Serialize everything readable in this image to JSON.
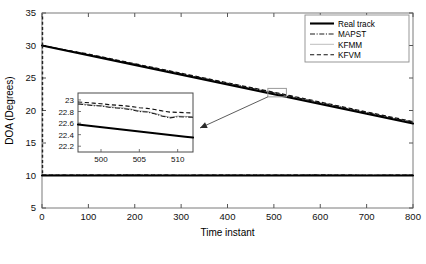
{
  "chart_data": {
    "type": "line",
    "title": "",
    "xlabel": "Time instant",
    "ylabel": "DOA (Degrees)",
    "xlim": [
      0,
      800
    ],
    "ylim": [
      5,
      35
    ],
    "xticks": [
      0,
      100,
      200,
      300,
      400,
      500,
      600,
      700,
      800
    ],
    "yticks": [
      5,
      10,
      15,
      20,
      25,
      30,
      35
    ],
    "grid": false,
    "legend_position": "top-right",
    "legend": [
      "Real track",
      "MAPST",
      "KFMM",
      "KFVM"
    ],
    "series": [
      {
        "name": "Real track",
        "style": "solid-thick",
        "color": "#000000",
        "targets": [
          {
            "label": "target-1-descending",
            "x": [
              0,
              100,
              200,
              300,
              400,
              500,
              600,
              700,
              800
            ],
            "y": [
              30.0,
              28.5,
              27.0,
              25.5,
              24.0,
              22.5,
              21.0,
              19.5,
              18.0
            ]
          },
          {
            "label": "target-2-stationary",
            "x": [
              0,
              100,
              200,
              300,
              400,
              500,
              600,
              700,
              800
            ],
            "y": [
              10.0,
              10.0,
              10.0,
              10.0,
              10.0,
              10.0,
              10.0,
              10.0,
              10.0
            ]
          }
        ]
      },
      {
        "name": "MAPST",
        "style": "dash-dot",
        "color": "#1a1a1a",
        "targets": [
          {
            "label": "target-1-descending",
            "x": [
              0,
              100,
              200,
              300,
              400,
              500,
              600,
              700,
              800
            ],
            "y": [
              30.0,
              28.62,
              27.14,
              25.66,
              24.18,
              22.72,
              21.2,
              19.68,
              18.2
            ]
          },
          {
            "label": "target-2-stationary",
            "x": [
              0,
              100,
              200,
              300,
              400,
              500,
              600,
              700,
              800
            ],
            "y": [
              10.05,
              10.04,
              10.06,
              10.03,
              10.05,
              10.04,
              10.06,
              10.03,
              10.05
            ]
          }
        ]
      },
      {
        "name": "KFMM",
        "style": "solid-thin-gray",
        "color": "#9a9a9a",
        "targets": [
          {
            "label": "target-1-descending",
            "x": [
              0,
              100,
              200,
              300,
              400,
              500,
              600,
              700,
              800
            ],
            "y": [
              30.0,
              28.6,
              27.12,
              25.64,
              24.16,
              22.7,
              21.18,
              19.66,
              18.18
            ]
          },
          {
            "label": "target-2-stationary",
            "x": [
              0,
              100,
              200,
              300,
              400,
              500,
              600,
              700,
              800
            ],
            "y": [
              10.04,
              10.03,
              10.05,
              10.02,
              10.04,
              10.03,
              10.05,
              10.02,
              10.04
            ]
          }
        ]
      },
      {
        "name": "KFVM",
        "style": "dashed",
        "color": "#111111",
        "targets": [
          {
            "label": "target-1-descending",
            "x": [
              0,
              100,
              200,
              300,
              400,
              500,
              600,
              700,
              800
            ],
            "y": [
              30.0,
              28.68,
              27.2,
              25.74,
              24.26,
              22.82,
              21.3,
              19.78,
              18.3
            ]
          },
          {
            "label": "target-2-stationary",
            "x": [
              0,
              100,
              200,
              300,
              400,
              500,
              600,
              700,
              800
            ],
            "y": [
              10.06,
              10.05,
              10.07,
              10.04,
              10.06,
              10.05,
              10.07,
              10.04,
              10.06
            ]
          }
        ]
      }
    ],
    "annotations": [
      {
        "type": "zoom-box",
        "x0": 487,
        "x1": 527,
        "y0": 22.1,
        "y1": 23.4
      },
      {
        "type": "arrow",
        "from_x": 487,
        "from_y": 22.1,
        "to_x": 380,
        "to_y": 20.6
      }
    ],
    "inset": {
      "type": "line",
      "xlim": [
        497,
        512
      ],
      "ylim": [
        22.1,
        23.12
      ],
      "xticks": [
        500,
        505,
        510
      ],
      "yticks": [
        22.2,
        22.4,
        22.6,
        22.8,
        23
      ],
      "ytick_labels": [
        "22.2",
        "22.4",
        "22.6",
        "22.8",
        "23"
      ],
      "xtick_labels": [
        "500",
        "505",
        "510"
      ],
      "series": [
        {
          "name": "Real track",
          "style": "solid-thick",
          "color": "#000000",
          "x": [
            497,
            499,
            501,
            503,
            505,
            507,
            509,
            511,
            512
          ],
          "y": [
            22.575,
            22.545,
            22.515,
            22.485,
            22.455,
            22.425,
            22.395,
            22.365,
            22.35
          ]
        },
        {
          "name": "MAPST",
          "style": "dash-dot",
          "color": "#1a1a1a",
          "x": [
            497,
            498,
            499,
            500,
            501,
            502,
            503,
            504,
            505,
            506,
            507,
            508,
            509,
            510,
            511,
            512
          ],
          "y": [
            22.93,
            22.915,
            22.9,
            22.895,
            22.875,
            22.86,
            22.85,
            22.83,
            22.8,
            22.79,
            22.76,
            22.72,
            22.69,
            22.71,
            22.705,
            22.7
          ]
        },
        {
          "name": "KFMM",
          "style": "solid-thin-gray",
          "color": "#9a9a9a",
          "x": [
            497,
            498,
            499,
            500,
            501,
            502,
            503,
            504,
            505,
            506,
            507,
            508,
            509,
            510,
            511,
            512
          ],
          "y": [
            22.94,
            22.925,
            22.91,
            22.9,
            22.885,
            22.87,
            22.86,
            22.84,
            22.81,
            22.8,
            22.77,
            22.73,
            22.7,
            22.72,
            22.715,
            22.71
          ]
        },
        {
          "name": "KFVM",
          "style": "dashed",
          "color": "#111111",
          "x": [
            497,
            498,
            499,
            500,
            501,
            502,
            503,
            504,
            505,
            506,
            507,
            508,
            509,
            510,
            511,
            512
          ],
          "y": [
            22.965,
            22.955,
            22.945,
            22.935,
            22.92,
            22.91,
            22.9,
            22.885,
            22.865,
            22.855,
            22.835,
            22.81,
            22.79,
            22.785,
            22.78,
            22.775
          ]
        }
      ]
    }
  }
}
